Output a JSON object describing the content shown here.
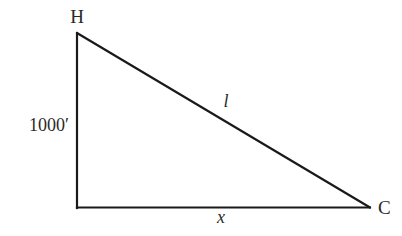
{
  "diagram": {
    "type": "right-triangle",
    "stroke_color": "#1a1a1a",
    "vertices": {
      "top": {
        "label": "H",
        "x": 77,
        "y": 33
      },
      "right_angle": {
        "label": "",
        "x": 77,
        "y": 207
      },
      "right": {
        "label": "C",
        "x": 370,
        "y": 207
      }
    },
    "sides": {
      "vertical": {
        "label": "1000′",
        "connects": [
          "H",
          "right_angle"
        ]
      },
      "hypotenuse": {
        "label": "l",
        "connects": [
          "H",
          "C"
        ]
      },
      "base": {
        "label": "x",
        "connects": [
          "right_angle",
          "C"
        ]
      }
    }
  }
}
